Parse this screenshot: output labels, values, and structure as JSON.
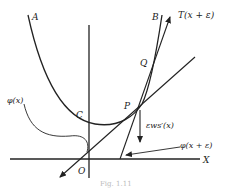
{
  "figure": {
    "labels": {
      "A": "A",
      "B": "B",
      "T": "T(x + ε)",
      "Q": "Q",
      "P": "P",
      "C": "C",
      "O": "O",
      "X": "X",
      "phi_x": "φ(x)",
      "phi_x_eps": "φ(x + ε)",
      "eps_ws": "εws′(x)"
    },
    "caption": "Fig. 1.11"
  }
}
